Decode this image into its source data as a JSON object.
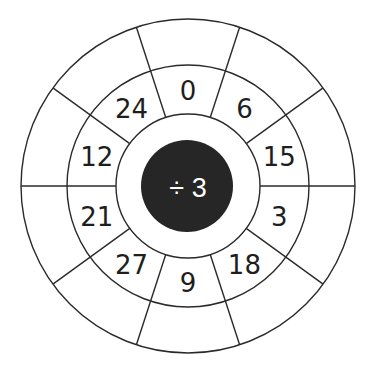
{
  "worksheet": {
    "operation": {
      "symbol": "÷",
      "operand": "3",
      "label": "÷ 3"
    },
    "segment_count": 10,
    "inner_ring_numbers": [
      {
        "position": "top",
        "value": "0"
      },
      {
        "position": "top-right",
        "value": "6"
      },
      {
        "position": "right-upper",
        "value": "15"
      },
      {
        "position": "right-lower",
        "value": "3"
      },
      {
        "position": "bottom-right",
        "value": "18"
      },
      {
        "position": "bottom",
        "value": "9"
      },
      {
        "position": "bottom-left",
        "value": "27"
      },
      {
        "position": "left-lower",
        "value": "21"
      },
      {
        "position": "left-upper",
        "value": "12"
      },
      {
        "position": "top-left",
        "value": "24"
      }
    ],
    "outer_ring_answers": [
      "",
      "",
      "",
      "",
      "",
      "",
      "",
      "",
      "",
      ""
    ]
  },
  "colors": {
    "line": "#2a2a2a",
    "hub_fill": "#262626",
    "hub_text": "#ffffff",
    "number_text": "#1e1e1e",
    "background": "#ffffff"
  }
}
